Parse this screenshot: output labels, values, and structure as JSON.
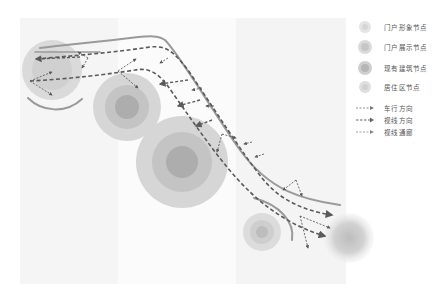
{
  "diagram": {
    "type": "site-analysis-map",
    "background_color": "#ffffff",
    "panel_color": "#f6f6f6",
    "road_color": "#9a9a9a",
    "arrow_color": "#5a5a5a",
    "node_colors": {
      "outer": "#d6d6d6",
      "middle": "#c4c4c4",
      "inner": "#adadad"
    }
  },
  "legend": {
    "nodes": [
      {
        "icon": "gateway-image-node-icon",
        "label": "门户形象节点"
      },
      {
        "icon": "gateway-display-node-icon",
        "label": "门户展示节点"
      },
      {
        "icon": "existing-building-node-icon",
        "label": "现有建筑节点"
      },
      {
        "icon": "residential-node-icon",
        "label": "居住区节点"
      }
    ],
    "lines": [
      {
        "icon": "dashed-arrow-thin-icon",
        "label": "车行方向"
      },
      {
        "icon": "dashed-arrow-bold-icon",
        "label": "视线方向"
      },
      {
        "icon": "dashed-arrow-corridor-icon",
        "label": "视线通廊"
      }
    ]
  }
}
